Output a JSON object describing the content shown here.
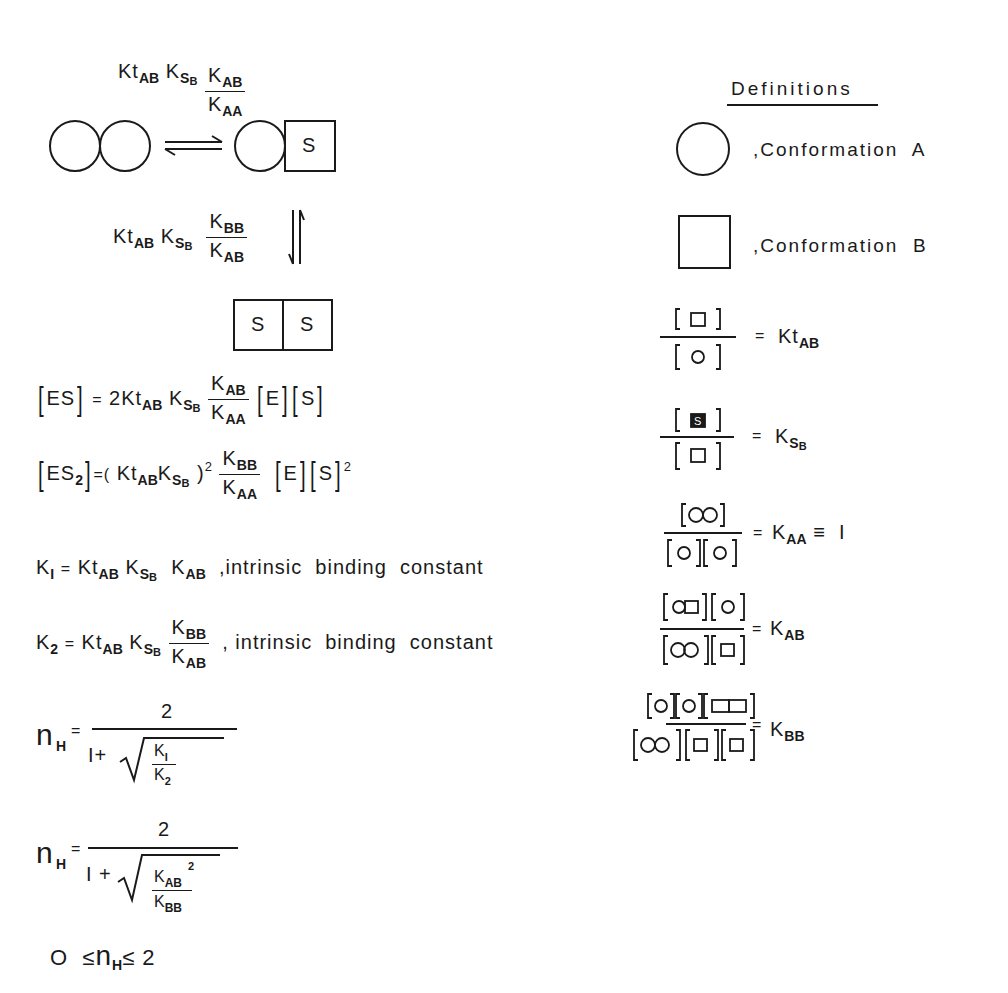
{
  "scheme": {
    "step1_rate": {
      "prefix": "Kt",
      "prefix_sub": "AB",
      "mid": "K",
      "mid_sub": "S",
      "mid_subsub": "B",
      "num": "K",
      "num_sub": "AB",
      "den": "K",
      "den_sub": "AA"
    },
    "step2_rate": {
      "prefix": "Kt",
      "prefix_sub": "AB",
      "mid": "K",
      "mid_sub": "S",
      "mid_subsub": "B",
      "num": "K",
      "num_sub": "BB",
      "den": "K",
      "den_sub": "AB"
    },
    "species": {
      "es_label": "S",
      "es2_labels": [
        "S",
        "S"
      ]
    },
    "arrows": {
      "horizontal": "⇌",
      "vertical": "⇅"
    }
  },
  "equations": {
    "es": {
      "lhs": "ES",
      "eq": "=",
      "coef": "2Kt",
      "coef_sub": "AB",
      "k": "K",
      "k_sub": "S",
      "k_subsub": "B",
      "num": "K",
      "num_sub": "AB",
      "den": "K",
      "den_sub": "AA",
      "e": "E",
      "s": "S"
    },
    "es2": {
      "lhs": "ES",
      "lhs_sub": "2",
      "eq": "=(",
      "kt": "Kt",
      "kt_sub": "AB",
      "k": "K",
      "k_sub": "S",
      "k_subsub": "B",
      "close": ")",
      "power": "2",
      "num": "K",
      "num_sub": "BB",
      "den": "K",
      "den_sub": "AA",
      "e": "E",
      "s": "S",
      "s_power": "2"
    },
    "k1": {
      "lhs": "K",
      "lhs_sub": "I",
      "eq": "=",
      "kt": "Kt",
      "kt_sub": "AB",
      "k": "K",
      "k_sub": "S",
      "k_subsub": "B",
      "kab": "K",
      "kab_sub": "AB",
      "note": ",intrinsic  binding  constant"
    },
    "k2": {
      "lhs": "K",
      "lhs_sub": "2",
      "eq": "=",
      "kt": "Kt",
      "kt_sub": "AB",
      "k": "K",
      "k_sub": "S",
      "k_subsub": "B",
      "num": "K",
      "num_sub": "BB",
      "den": "K",
      "den_sub": "AB",
      "note": ", intrinsic  binding  constant"
    },
    "nh1": {
      "lhs": "n",
      "lhs_sub": "H",
      "eq": "=",
      "num": "2",
      "den_prefix": "I+",
      "rad_num": "K",
      "rad_num_sub": "I",
      "rad_den": "K",
      "rad_den_sub": "2"
    },
    "nh2": {
      "lhs": "n",
      "lhs_sub": "H",
      "eq": "=",
      "num": "2",
      "den_prefix": "I +",
      "rad_num": "K",
      "rad_num_sub": "AB",
      "rad_num_sup": "2",
      "rad_den": "K",
      "rad_den_sub": "BB"
    },
    "range": {
      "low": "O",
      "le1": "≤",
      "n": "n",
      "n_sub": "H",
      "le2": "≤",
      "high": "2"
    }
  },
  "definitions": {
    "heading": "Definitions",
    "conf_a": ",Conformation  A",
    "conf_b": ",Conformation  B",
    "kt": {
      "eq": "=",
      "k": "Kt",
      "sub": "AB"
    },
    "ks": {
      "eq": "=",
      "k": "K",
      "sub": "S",
      "subsub": "B"
    },
    "kaa": {
      "eq": "=",
      "k": "K",
      "sub": "AA",
      "tail": "≡  I"
    },
    "kab": {
      "eq": "=",
      "k": "K",
      "sub": "AB"
    },
    "kbb": {
      "eq": "=",
      "k": "K",
      "sub": "BB"
    }
  }
}
